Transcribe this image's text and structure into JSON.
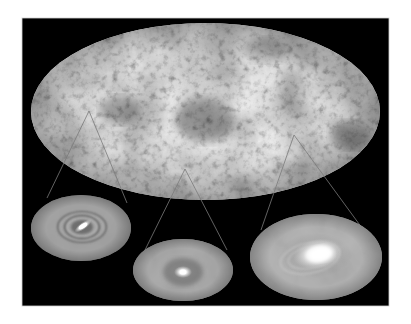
{
  "figure": {
    "width": 411,
    "height": 324,
    "page_background": "#ffffff",
    "panel": {
      "x": 22,
      "y": 18,
      "width": 367,
      "height": 288,
      "fill": "#000000",
      "edge": "#cfcfcf"
    },
    "sky_map": {
      "label": "all-sky map",
      "projection": "mollweide-ellipse",
      "cx": 205.5,
      "cy": 111.5,
      "rx": 174.5,
      "ry": 88.5,
      "base_color": "#8e8e8e"
    },
    "connector_color": "#7a7a7a",
    "insets": [
      {
        "label": "inset-1 barred ring structure",
        "cx": 81,
        "cy": 228,
        "rx": 50,
        "ry": 33,
        "base_color": "#8f8f8f",
        "core": {
          "cx": 83,
          "cy": 226,
          "rx": 10,
          "ry": 4,
          "rotate": -35
        },
        "rings": [
          {
            "rx": 17,
            "ry": 11
          },
          {
            "rx": 24,
            "ry": 15
          }
        ],
        "connector": {
          "apex": [
            89,
            111
          ],
          "left": [
            47,
            198
          ],
          "right": [
            127,
            203
          ]
        }
      },
      {
        "label": "inset-2 compact bright core",
        "cx": 183,
        "cy": 270,
        "rx": 50,
        "ry": 31,
        "base_color": "#868686",
        "core": {
          "cx": 183,
          "cy": 272,
          "rx": 9,
          "ry": 6,
          "rotate": 0
        },
        "rings": [],
        "connector": {
          "apex": [
            185,
            169
          ],
          "left": [
            145,
            250
          ],
          "right": [
            227,
            250
          ]
        }
      },
      {
        "label": "inset-3 large spiral glow",
        "cx": 316,
        "cy": 257,
        "rx": 66,
        "ry": 43,
        "base_color": "#838383",
        "core": {
          "cx": 317,
          "cy": 255,
          "rx": 25,
          "ry": 15,
          "rotate": -10
        },
        "rings": [
          {
            "rx": 30,
            "ry": 17
          }
        ],
        "connector": {
          "apex": [
            294,
            135
          ],
          "left": [
            261,
            230
          ],
          "right": [
            362,
            228
          ]
        }
      }
    ]
  }
}
